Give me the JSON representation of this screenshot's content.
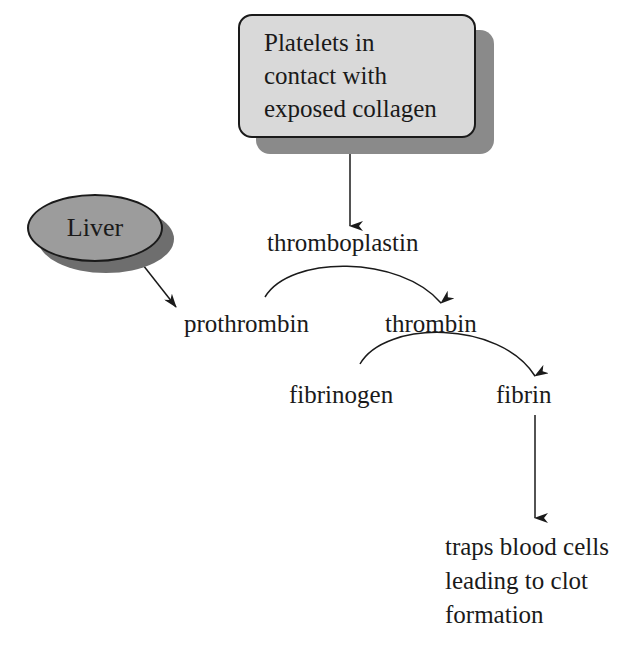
{
  "diagram": {
    "type": "flowchart",
    "nodes": {
      "platelets": {
        "lines": [
          "Platelets in",
          "contact with",
          "exposed collagen"
        ],
        "shape": "rounded-rectangle",
        "fill": "#d9d9d9"
      },
      "liver": {
        "label": "Liver",
        "shape": "ellipse",
        "fill": "#9c9c9c"
      },
      "thromboplastin": {
        "label": "thromboplastin"
      },
      "prothrombin": {
        "label": "prothrombin"
      },
      "thrombin": {
        "label": "thrombin"
      },
      "fibrinogen": {
        "label": "fibrinogen"
      },
      "fibrin": {
        "label": "fibrin"
      },
      "outcome": {
        "lines": [
          "traps blood cells",
          "leading to clot",
          "formation"
        ]
      }
    },
    "edges": [
      {
        "from": "platelets",
        "to": "thromboplastin",
        "style": "straight-arrow"
      },
      {
        "from": "liver",
        "to": "prothrombin",
        "style": "straight-arrow"
      },
      {
        "from": "prothrombin",
        "to": "thrombin",
        "style": "curved-arrow",
        "catalyst": "thromboplastin"
      },
      {
        "from": "fibrinogen",
        "to": "fibrin",
        "style": "curved-arrow",
        "catalyst": "thrombin"
      },
      {
        "from": "fibrin",
        "to": "outcome",
        "style": "straight-arrow"
      }
    ],
    "colors": {
      "line": "#1a1a1a",
      "shadow_box": "#8a8a8a",
      "shadow_ellipse": "#6e6e6e"
    }
  }
}
